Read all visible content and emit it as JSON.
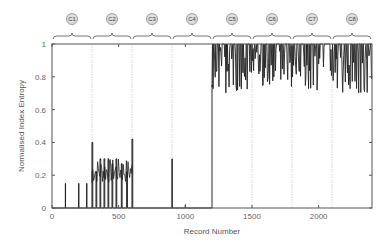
{
  "chart_data": {
    "type": "line",
    "title": "",
    "xlabel": "Record Number",
    "ylabel": "Normalised Index Entropy",
    "xlim": [
      0,
      2400
    ],
    "ylim": [
      0,
      1
    ],
    "xticks": [
      0,
      500,
      1000,
      1500,
      2000
    ],
    "yticks": [
      0,
      0.2,
      0.4,
      0.6,
      0.8,
      1
    ],
    "ytick_labels": [
      "0",
      "0.2",
      "0.4",
      "0.6",
      "0.8",
      "1"
    ],
    "xtick_labels": [
      "0",
      "500",
      "1000",
      "1500",
      "2000"
    ],
    "grid": false,
    "segment_boundaries": [
      300,
      600,
      900,
      1200,
      1500,
      1800,
      2100
    ],
    "segments": [
      {
        "label": "C1",
        "start": 0,
        "end": 300
      },
      {
        "label": "C2",
        "start": 300,
        "end": 600
      },
      {
        "label": "C3",
        "start": 600,
        "end": 900
      },
      {
        "label": "C4",
        "start": 900,
        "end": 1200
      },
      {
        "label": "C5",
        "start": 1200,
        "end": 1500
      },
      {
        "label": "C6",
        "start": 1500,
        "end": 1800
      },
      {
        "label": "C7",
        "start": 1800,
        "end": 2100
      },
      {
        "label": "C8",
        "start": 2100,
        "end": 2400
      }
    ],
    "series": [
      {
        "name": "Normalised Index Entropy",
        "description": "Near 0 for records 0-1200 with sparse spikes (~0.15 in C1, 0.15-0.4 in C2, ~0.3 at ~900); jumps to ~0.7-1.0 oscillating for records 1200-2400",
        "spikes_low_region": [
          {
            "x": 100,
            "y": 0.15
          },
          {
            "x": 200,
            "y": 0.15
          },
          {
            "x": 260,
            "y": 0.15
          },
          {
            "x": 300,
            "y": 0.4
          },
          {
            "x": 330,
            "y": 0.22
          },
          {
            "x": 360,
            "y": 0.3
          },
          {
            "x": 390,
            "y": 0.3
          },
          {
            "x": 420,
            "y": 0.3
          },
          {
            "x": 450,
            "y": 0.27
          },
          {
            "x": 480,
            "y": 0.3
          },
          {
            "x": 520,
            "y": 0.27
          },
          {
            "x": 560,
            "y": 0.22
          },
          {
            "x": 600,
            "y": 0.42
          },
          {
            "x": 900,
            "y": 0.3
          },
          {
            "x": 1000,
            "y": 0.02
          }
        ],
        "high_region_range": [
          0.7,
          1.0
        ],
        "high_region_start": 1200
      }
    ]
  }
}
